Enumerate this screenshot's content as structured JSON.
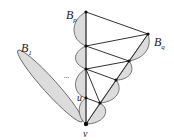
{
  "labels": {
    "Bp": {
      "main": "B",
      "sub": "p"
    },
    "Bq": {
      "main": "B",
      "sub": "q"
    },
    "B1": {
      "main": "B",
      "sub": "1"
    },
    "u": "u",
    "v": "v",
    "ellipsis": "..."
  },
  "colors": {
    "fill": "#dcdcdc",
    "stroke": "#333333",
    "background": "#ffffff"
  }
}
